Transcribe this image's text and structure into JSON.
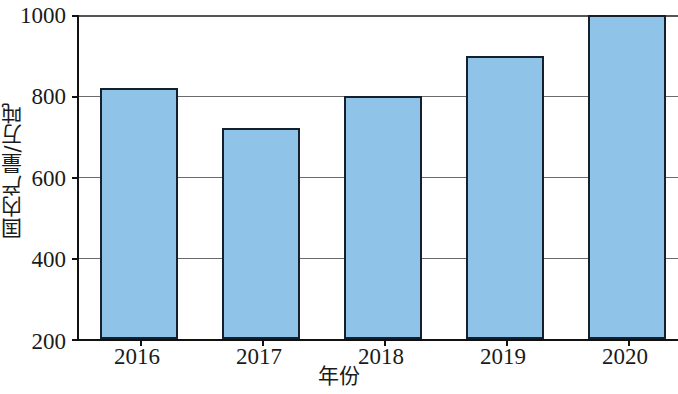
{
  "chart_data": {
    "type": "bar",
    "title": "",
    "subtitle": "",
    "xlabel": "年份",
    "ylabel": "国内产量/万吨",
    "categories": [
      "2016",
      "2017",
      "2018",
      "2019",
      "2020"
    ],
    "values": [
      820,
      720,
      800,
      900,
      1000
    ],
    "series": [
      {
        "name": "国内产量",
        "values": [
          820,
          720,
          800,
          900,
          1000
        ]
      }
    ],
    "ylim": [
      200,
      1000
    ],
    "yticks": [
      200,
      400,
      600,
      800,
      1000
    ],
    "ytick_labels": [
      "200",
      "400",
      "600",
      "800",
      "1000"
    ],
    "xtick_labels": [
      "2016",
      "2017",
      "2018",
      "2019",
      "2020"
    ],
    "grid": true,
    "grid_axis": "y",
    "legend": false,
    "legend_position": "none",
    "bar_color": "#8fc4e8",
    "bar_edge_color": "#14202e",
    "axis_color": "#111111",
    "gridline_color": "#6b6b6b",
    "background_color": "#ffffff"
  },
  "axes": {
    "y_title": "国内产量/万吨",
    "x_title": "年份"
  }
}
